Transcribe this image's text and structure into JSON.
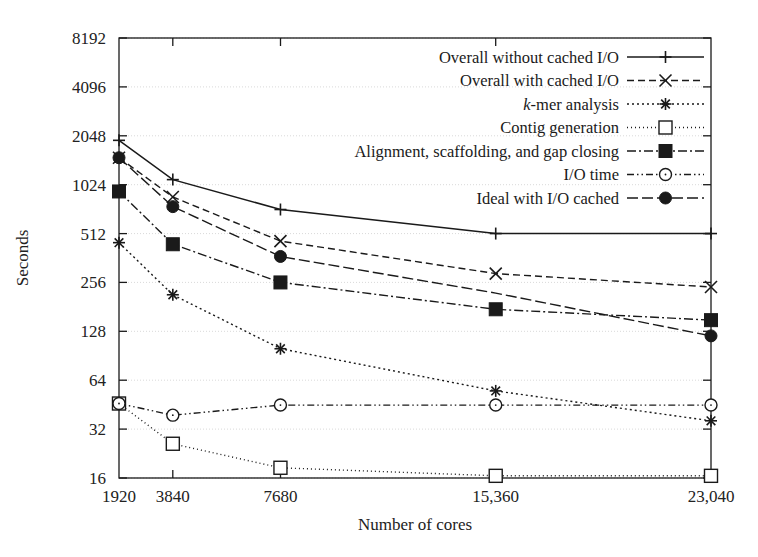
{
  "chart_data": {
    "type": "line",
    "title": "",
    "xlabel": "Number of cores",
    "ylabel": "Seconds",
    "x": [
      1920,
      3840,
      7680,
      15360,
      23040
    ],
    "xtick_labels": [
      "1920",
      "3840",
      "7680",
      "15,360",
      "23,040"
    ],
    "ytick_labels": [
      "16",
      "32",
      "64",
      "128",
      "256",
      "512",
      "1024",
      "2048",
      "4096",
      "8192"
    ],
    "ytick_values": [
      16,
      32,
      64,
      128,
      256,
      512,
      1024,
      2048,
      4096,
      8192
    ],
    "yscale": "log2",
    "ylim": [
      16,
      8192
    ],
    "grid": true,
    "legend_position": "top-right",
    "series": [
      {
        "name": "Overall without cached I/O",
        "marker": "plus",
        "dash": "solid",
        "values": [
          1920,
          1100,
          720,
          512,
          512
        ]
      },
      {
        "name": "Overall with cached I/O",
        "marker": "cross",
        "dash": "dashed",
        "values": [
          1500,
          860,
          460,
          290,
          240
        ]
      },
      {
        "name": "k-mer analysis",
        "marker": "asterisk",
        "dash": "dotted",
        "values": [
          450,
          215,
          100,
          55,
          36
        ]
      },
      {
        "name": "Contig generation",
        "marker": "open-square",
        "dash": "fine-dotted",
        "values": [
          46,
          26,
          18.5,
          16.5,
          16.5
        ]
      },
      {
        "name": "Alignment, scaffolding, and gap closing",
        "marker": "filled-square",
        "dash": "dash-dot",
        "values": [
          930,
          440,
          256,
          175,
          150
        ]
      },
      {
        "name": "I/O time",
        "marker": "open-circle",
        "dash": "dash-dot-dot",
        "values": [
          46,
          39,
          45,
          45,
          45
        ]
      },
      {
        "name": "Ideal with I/O cached",
        "marker": "filled-circle",
        "dash": "long-dash",
        "values": [
          1500,
          750,
          370,
          220,
          120
        ]
      }
    ]
  },
  "axes": {
    "ylabel": "Seconds",
    "xlabel": "Number of cores"
  },
  "legend": {
    "entries": [
      {
        "label": "Overall without cached I/O",
        "italic_prefix": ""
      },
      {
        "label": "Overall with cached I/O",
        "italic_prefix": ""
      },
      {
        "label": "-mer analysis",
        "italic_prefix": "k"
      },
      {
        "label": "Contig generation",
        "italic_prefix": ""
      },
      {
        "label": "Alignment, scaffolding, and gap closing",
        "italic_prefix": ""
      },
      {
        "label": "I/O time",
        "italic_prefix": ""
      },
      {
        "label": "Ideal with I/O cached",
        "italic_prefix": ""
      }
    ]
  },
  "colors": {
    "ink": "#1a1a1a",
    "grid": "#d9d9d9",
    "background": "#ffffff"
  }
}
